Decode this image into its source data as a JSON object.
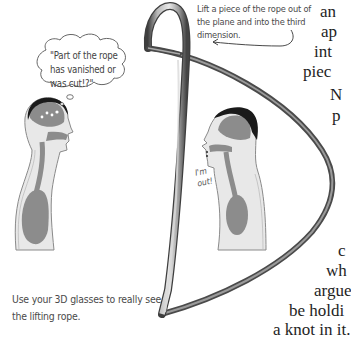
{
  "captions": {
    "lift_rope": "Lift a piece of the rope out of the plane and into the third dimension.",
    "thought_bubble": "\"Part of the rope has vanished or was cut!?\"",
    "speech_im_out": "I'm out!",
    "glasses_note": "Use your 3D glasses to really see the lifting rope."
  },
  "body_text_fragments": {
    "top": [
      "an",
      "ap",
      "int",
      "piec"
    ],
    "middle": [
      "N",
      "p"
    ],
    "bottom": [
      "c",
      "wh",
      "argue",
      "be holdi",
      "a knot in it."
    ]
  },
  "figures": [
    {
      "name": "left-person",
      "facing": "right",
      "state": "thinking"
    },
    {
      "name": "right-person",
      "facing": "left",
      "state": "speaking"
    }
  ],
  "colors": {
    "rope_dark": "#4a4a4a",
    "rope_mid": "#8a8a8a",
    "rope_light": "#d0d0d0",
    "body_fill": "#e6e6e6",
    "organ_fill": "#8c8c8c",
    "hair": "#1a1a1a",
    "caption_text": "#4a4a4a",
    "body_text": "#1e1e1e"
  }
}
